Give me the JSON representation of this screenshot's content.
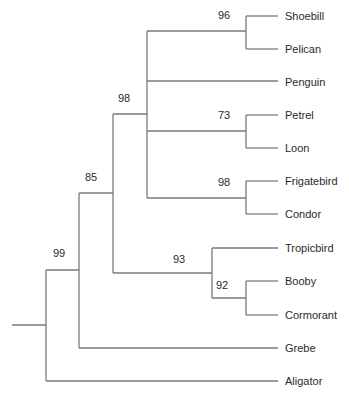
{
  "diagram": {
    "type": "phylogenetic-tree",
    "line_color": "#7a7a7a",
    "text_color": "#2a2a2a",
    "leaves": [
      {
        "name": "Shoebill",
        "y": 16
      },
      {
        "name": "Pelican",
        "y": 49
      },
      {
        "name": "Penguin",
        "y": 82
      },
      {
        "name": "Petrel",
        "y": 115
      },
      {
        "name": "Loon",
        "y": 148
      },
      {
        "name": "Frigatebird",
        "y": 181
      },
      {
        "name": "Condor",
        "y": 214
      },
      {
        "name": "Tropicbird",
        "y": 248
      },
      {
        "name": "Booby",
        "y": 281
      },
      {
        "name": "Cormorant",
        "y": 315
      },
      {
        "name": "Grebe",
        "y": 348
      },
      {
        "name": "Aligator",
        "y": 381
      }
    ],
    "support_values": [
      {
        "label": "96",
        "clade": "Shoebill+Pelican"
      },
      {
        "label": "73",
        "clade": "Petrel+Loon"
      },
      {
        "label": "98",
        "clade": "Frigatebird+Condor"
      },
      {
        "label": "98",
        "clade": "Shoebill..Condor"
      },
      {
        "label": "93",
        "clade": "Tropicbird+Booby+Cormorant"
      },
      {
        "label": "92",
        "clade": "Booby+Cormorant"
      },
      {
        "label": "85",
        "clade": "Shoebill..Cormorant"
      },
      {
        "label": "99",
        "clade": "Ingroup (all birds)"
      }
    ]
  }
}
